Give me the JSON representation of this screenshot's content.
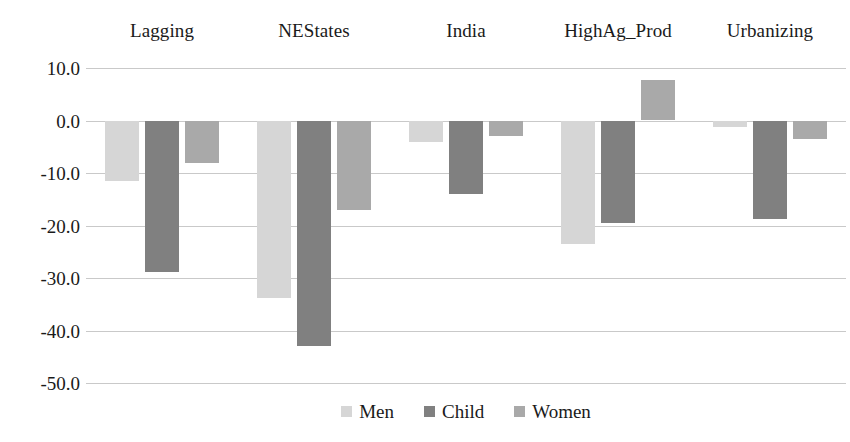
{
  "chart_data": {
    "type": "bar",
    "title": "",
    "subtitle": "",
    "xlabel": "",
    "ylabel": "",
    "categories": [
      "Lagging",
      "NEStates",
      "India",
      "HighAg_Prod",
      "Urbanizing"
    ],
    "series": [
      {
        "name": "Men",
        "color": "#d6d6d6",
        "values": [
          -11.6,
          -33.8,
          -4.0,
          -23.5,
          -1.2
        ]
      },
      {
        "name": "Child",
        "color": "#808080",
        "values": [
          -28.8,
          -43.0,
          -14.0,
          -19.5,
          -18.7
        ]
      },
      {
        "name": "Women",
        "color": "#a9a9a9",
        "values": [
          -8.0,
          -17.0,
          -3.0,
          7.8,
          -3.5
        ]
      }
    ],
    "ylim": [
      -50.0,
      10.0
    ],
    "ytick_values": [
      10.0,
      0.0,
      -10.0,
      -20.0,
      -30.0,
      -40.0,
      -50.0
    ],
    "ytick_labels": [
      "10.0",
      "0.0",
      "-10.0",
      "-20.0",
      "-30.0",
      "-40.0",
      "-50.0"
    ],
    "grid": true,
    "grid_color": "#c9c9c9",
    "legend_position": "bottom",
    "category_label_position": "top",
    "background": "#ffffff"
  }
}
